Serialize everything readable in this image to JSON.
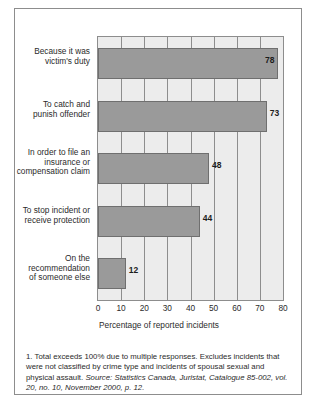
{
  "chart_data": {
    "type": "bar",
    "orientation": "horizontal",
    "title": "",
    "subtitle": "",
    "xlabel": "Percentage of reported incidents",
    "ylabel": "",
    "xlim": [
      0,
      80
    ],
    "xticks": [
      0,
      10,
      20,
      30,
      40,
      50,
      60,
      70,
      80
    ],
    "grid": true,
    "legend": "none",
    "categories": [
      "Because it was victim's duty",
      "To catch and punish offender",
      "In order to file an insurance or compensation claim",
      "To stop incident or receive protection",
      "On the recommendation of someone else"
    ],
    "category_lines": [
      [
        "Because it was",
        "victim's duty"
      ],
      [
        "To catch and",
        "punish offender"
      ],
      [
        "In order to file an",
        "insurance or",
        "compensation claim"
      ],
      [
        "To stop incident or",
        "receive protection"
      ],
      [
        "On the",
        "recommendation",
        "of someone else"
      ]
    ],
    "values": [
      78,
      73,
      48,
      44,
      12
    ],
    "value_labels": [
      "78",
      "73",
      "48",
      "44",
      "12"
    ],
    "label_placement": [
      "inside",
      "outside",
      "outside",
      "outside",
      "outside"
    ],
    "bar_color": "#9a9a9a",
    "plot_background": "#ececec",
    "axis_color": "#8d8d8d"
  },
  "footnote": {
    "note_number": "1.",
    "note_text": "Total exceeds 100% due to multiple responses. Excludes incidents that were not classified by crime type and incidents of spousal sexual and physical assault.",
    "source_label": "Source:",
    "source_pre": " Statistics Canada, ",
    "source_journal": "Juristat",
    "source_post": ", Catalogue 85-002, vol. 20, no. 10, November 2000, p. 12."
  }
}
